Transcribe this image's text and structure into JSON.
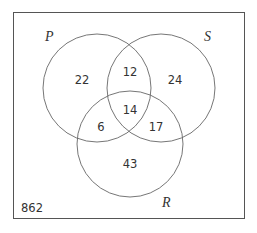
{
  "diagram": {
    "type": "venn",
    "sets": {
      "P": {
        "label": "P"
      },
      "S": {
        "label": "S"
      },
      "R": {
        "label": "R"
      }
    },
    "regions": {
      "P_only": "22",
      "S_only": "24",
      "R_only": "43",
      "P_S_only": "12",
      "P_R_only": "6",
      "S_R_only": "17",
      "P_S_R": "14",
      "outside": "862"
    }
  }
}
